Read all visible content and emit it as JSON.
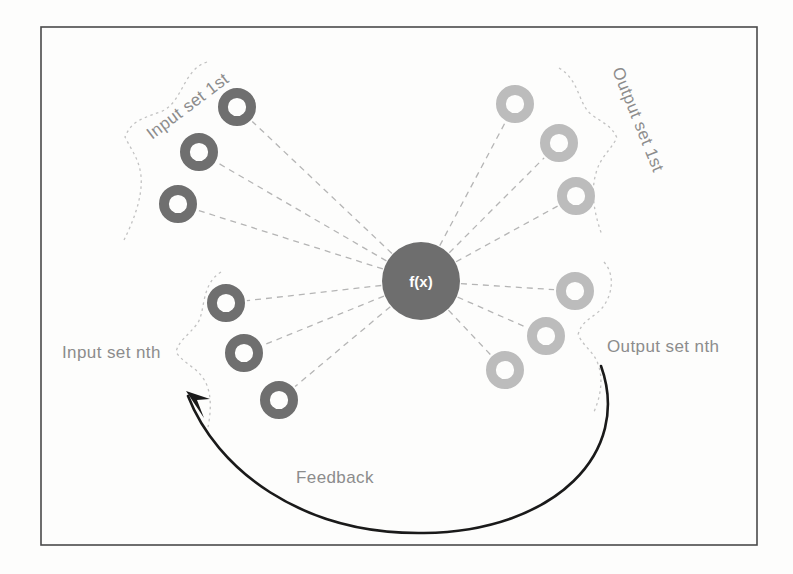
{
  "diagram": {
    "frame": {
      "x": 41,
      "y": 27,
      "width": 716,
      "height": 518,
      "stroke": "#4a4a4a"
    },
    "center_node": {
      "label": "f(x)",
      "cx": 421,
      "cy": 281,
      "r": 39,
      "fill": "#6e6e6e",
      "text_color": "#ffffff"
    },
    "colors": {
      "input_ring": "#6f6f6f",
      "output_ring": "#bcbcbc",
      "connector": "#b5b5b5",
      "brace": "#c2c2c2",
      "label_text": "#8c8c8c",
      "feedback_arrow": "#1a1a1a",
      "frame": "#4a4a4a",
      "background": "#fdfdfc"
    },
    "groups": [
      {
        "name": "input-set-1st",
        "label": "Input set 1st",
        "kind": "input",
        "label_x": 152,
        "label_y": 140,
        "label_rotate": -37,
        "ring_color": "#6f6f6f",
        "nodes": [
          {
            "cx": 237,
            "cy": 107,
            "r": 19
          },
          {
            "cx": 199,
            "cy": 152,
            "r": 19
          },
          {
            "cx": 178,
            "cy": 204,
            "r": 19
          }
        ]
      },
      {
        "name": "input-set-nth",
        "label": "Input set nth",
        "kind": "input",
        "label_x": 62,
        "label_y": 358,
        "label_rotate": 0,
        "ring_color": "#6f6f6f",
        "nodes": [
          {
            "cx": 226,
            "cy": 303,
            "r": 19
          },
          {
            "cx": 244,
            "cy": 353,
            "r": 19
          },
          {
            "cx": 279,
            "cy": 400,
            "r": 19
          }
        ]
      },
      {
        "name": "output-set-1st",
        "label": "Output set 1st",
        "kind": "output",
        "label_x": 612,
        "label_y": 70,
        "label_rotate": 68,
        "ring_color": "#bcbcbc",
        "nodes": [
          {
            "cx": 515,
            "cy": 104,
            "r": 19
          },
          {
            "cx": 559,
            "cy": 143,
            "r": 19
          },
          {
            "cx": 576,
            "cy": 196,
            "r": 19
          }
        ]
      },
      {
        "name": "output-set-nth",
        "label": "Output set nth",
        "kind": "output",
        "label_x": 607,
        "label_y": 352,
        "label_rotate": 0,
        "ring_color": "#bcbcbc",
        "nodes": [
          {
            "cx": 575,
            "cy": 291,
            "r": 19
          },
          {
            "cx": 546,
            "cy": 336,
            "r": 19
          },
          {
            "cx": 505,
            "cy": 370,
            "r": 19
          }
        ]
      }
    ],
    "connectors": [
      {
        "from": "center",
        "to": [
          237,
          107
        ]
      },
      {
        "from": "center",
        "to": [
          199,
          152
        ]
      },
      {
        "from": "center",
        "to": [
          178,
          204
        ]
      },
      {
        "from": "center",
        "to": [
          226,
          303
        ]
      },
      {
        "from": "center",
        "to": [
          244,
          353
        ]
      },
      {
        "from": "center",
        "to": [
          279,
          400
        ]
      },
      {
        "from": "center",
        "to": [
          515,
          104
        ]
      },
      {
        "from": "center",
        "to": [
          559,
          143
        ]
      },
      {
        "from": "center",
        "to": [
          576,
          196
        ]
      },
      {
        "from": "center",
        "to": [
          575,
          291
        ]
      },
      {
        "from": "center",
        "to": [
          546,
          336
        ]
      },
      {
        "from": "center",
        "to": [
          505,
          370
        ]
      }
    ],
    "feedback": {
      "label": "Feedback",
      "label_x": 296,
      "label_y": 483,
      "path": "M 601 366 C 632 452 556 531 424 533 C 300 535 216 468 188 396",
      "arrow_tip": [
        186,
        391
      ],
      "stroke": "#1a1a1a",
      "stroke_width": 2.6
    },
    "braces": [
      {
        "name": "brace-input-1st",
        "d": "M 207 62 C 182 70 183 104 160 112 C 137 120 131 123 125 137 C 133 153 139 159 141 176 C 143 197 133 222 124 240"
      },
      {
        "name": "brace-input-nth",
        "d": "M 221 272 C 200 285 206 312 197 324 C 188 336 179 340 176 352 C 184 364 196 367 203 378 C 213 392 211 414 207 432"
      },
      {
        "name": "brace-output-1st",
        "d": "M 559 68 C 580 80 578 105 592 115 C 603 123 612 126 617 138 C 609 152 600 158 596 173 C 590 193 595 216 602 235"
      },
      {
        "name": "brace-output-nth",
        "d": "M 604 262 C 618 278 610 303 597 313 C 588 320 581 323 578 335 C 585 348 594 352 598 364 C 604 380 600 399 593 414"
      }
    ]
  }
}
